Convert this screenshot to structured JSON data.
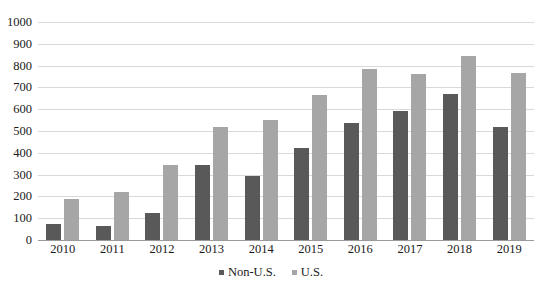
{
  "chart_data": {
    "type": "bar",
    "title": "",
    "subtitle": "",
    "xlabel": "",
    "ylabel": "",
    "categories": [
      "2010",
      "2011",
      "2012",
      "2013",
      "2014",
      "2015",
      "2016",
      "2017",
      "2018",
      "2019"
    ],
    "series": [
      {
        "name": "Non-U.S.",
        "color": "#595959",
        "values": [
          72,
          63,
          125,
          345,
          295,
          420,
          535,
          590,
          670,
          520
        ]
      },
      {
        "name": "U.S.",
        "color": "#a6a6a6",
        "values": [
          190,
          220,
          345,
          520,
          550,
          665,
          785,
          760,
          845,
          765
        ]
      }
    ],
    "ylim": [
      0,
      1000
    ],
    "ytick_step": 100,
    "yticks": [
      "1000",
      "900",
      "800",
      "700",
      "600",
      "500",
      "400",
      "300",
      "200",
      "100",
      "0"
    ],
    "grid": true,
    "legend_position": "bottom-center"
  }
}
